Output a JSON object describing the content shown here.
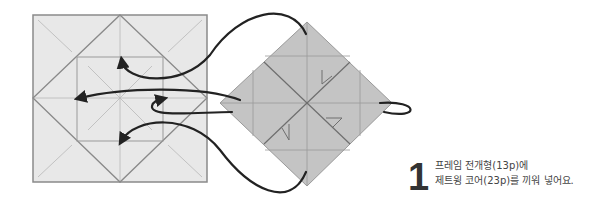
{
  "instruction": {
    "step_number": "1",
    "line1": "프레임 전개형(13p)에",
    "line2": "제트윙 코어(23p)를 끼워 넣어요."
  },
  "colors": {
    "frame_fill": "#e8e8e8",
    "frame_stroke": "#8a8a8a",
    "crease": "#b0b0b0",
    "core_fill": "#c4c4c4",
    "core_stroke": "#8a8a8a",
    "arrow": "#222222",
    "text": "#444444"
  }
}
